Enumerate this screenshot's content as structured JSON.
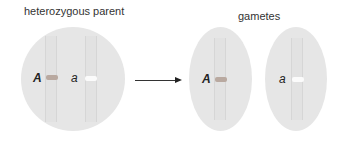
{
  "labels": {
    "parent": "heterozygous parent",
    "gametes": "gametes"
  },
  "parent_cell": {
    "alleles": [
      {
        "symbol": "A",
        "band_color": "#b9a9a0"
      },
      {
        "symbol": "a",
        "band_color": "#fbfbfb"
      }
    ]
  },
  "gamete_cells": [
    {
      "allele": {
        "symbol": "A",
        "band_color": "#b9a9a0"
      }
    },
    {
      "allele": {
        "symbol": "a",
        "band_color": "#fbfbfb"
      }
    }
  ],
  "colors": {
    "cell_fill": "#e6e6e6",
    "text": "#333333",
    "arrow": "#222222"
  }
}
